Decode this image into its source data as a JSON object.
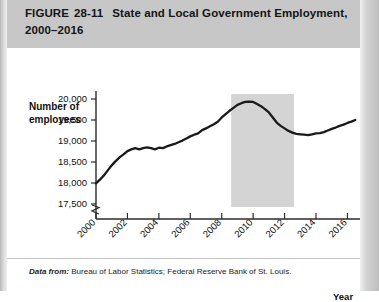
{
  "figure": {
    "label": "FIGURE",
    "number": "28-11",
    "title_line1": "State and Local Government Employment,",
    "title_line2": "2000–2016"
  },
  "footnote": {
    "source_label": "Data from:",
    "source_text": "Bureau of Labor Statistics; Federal Reserve Bank of St. Louis."
  },
  "colors": {
    "header_background": "#c7c7c7",
    "panel_background": "#ffffff",
    "line": "#1a1a1a",
    "recession_band": "#d4d4d4",
    "axis": "#2b2b2b",
    "text": "#111111"
  },
  "chart_data": {
    "type": "line",
    "title": "State and Local Government Employment, 2000–2016",
    "xlabel": "Year",
    "ylabel": "Number of employees",
    "ylabel_line1": "Number of",
    "ylabel_line2": "employees",
    "grid": false,
    "legend": "none",
    "y_axis_break": true,
    "xlim": [
      2000,
      2016.8
    ],
    "ylim": [
      17500,
      20250
    ],
    "ytick_labels": [
      "20,000",
      "19,500",
      "19,000",
      "18,500",
      "18,000",
      "17,500"
    ],
    "yticks": [
      20000,
      19500,
      19000,
      18500,
      18000,
      17500
    ],
    "xtick_labels": [
      "2000",
      "2002",
      "2004",
      "2006",
      "2008",
      "2010",
      "2012",
      "2014",
      "2016"
    ],
    "xticks": [
      2000,
      2002,
      2004,
      2006,
      2008,
      2010,
      2012,
      2014,
      2016
    ],
    "annotations": [
      {
        "type": "shaded-band",
        "name": "recession-band",
        "x_start": 2008.6,
        "x_end": 2012.6,
        "color": "#d4d4d4"
      }
    ],
    "series": [
      {
        "name": "State and local government employment (thousands)",
        "x": [
          2000.0,
          2000.25,
          2000.5,
          2000.75,
          2001.0,
          2001.25,
          2001.5,
          2001.75,
          2002.0,
          2002.25,
          2002.5,
          2002.75,
          2003.0,
          2003.25,
          2003.5,
          2003.75,
          2004.0,
          2004.25,
          2004.5,
          2004.75,
          2005.0,
          2005.25,
          2005.5,
          2005.75,
          2006.0,
          2006.25,
          2006.5,
          2006.75,
          2007.0,
          2007.25,
          2007.5,
          2007.75,
          2008.0,
          2008.25,
          2008.5,
          2008.75,
          2009.0,
          2009.25,
          2009.5,
          2009.75,
          2010.0,
          2010.25,
          2010.5,
          2010.75,
          2011.0,
          2011.25,
          2011.5,
          2011.75,
          2012.0,
          2012.25,
          2012.5,
          2012.75,
          2013.0,
          2013.25,
          2013.5,
          2013.75,
          2014.0,
          2014.25,
          2014.5,
          2014.75,
          2015.0,
          2015.25,
          2015.5,
          2015.75,
          2016.0,
          2016.25,
          2016.5
        ],
        "y": [
          17990,
          18080,
          18180,
          18300,
          18420,
          18520,
          18610,
          18680,
          18760,
          18800,
          18830,
          18800,
          18830,
          18850,
          18830,
          18800,
          18840,
          18830,
          18870,
          18900,
          18930,
          18970,
          19010,
          19060,
          19110,
          19150,
          19180,
          19260,
          19300,
          19350,
          19400,
          19460,
          19560,
          19640,
          19720,
          19790,
          19860,
          19900,
          19930,
          19940,
          19930,
          19880,
          19830,
          19760,
          19680,
          19560,
          19440,
          19360,
          19300,
          19240,
          19200,
          19170,
          19160,
          19150,
          19140,
          19160,
          19180,
          19190,
          19210,
          19250,
          19290,
          19320,
          19360,
          19390,
          19430,
          19460,
          19500
        ]
      }
    ]
  }
}
